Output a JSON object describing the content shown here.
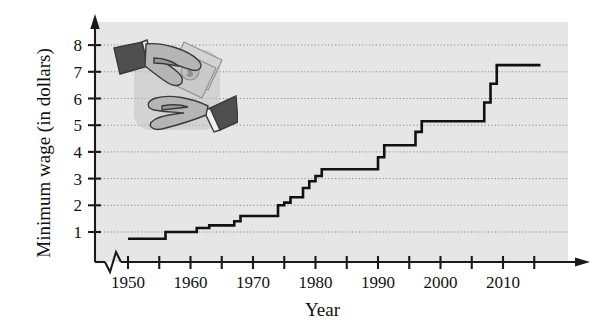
{
  "figure": {
    "width": 599,
    "height": 333,
    "background": "#ffffff",
    "plot_background": "#e6e6e6",
    "line_color": "#111111",
    "grid_color": "#8a8a8a",
    "axis_color": "#1a1a1a"
  },
  "illustration": {
    "name": "hands-exchanging-money",
    "description": "Two grayscale cartoon hands exchanging dollar bills",
    "colors": {
      "cuff_dark": "#4f4f4f",
      "skin": "#b5b5b5",
      "skin_shadow": "#9a9a9a",
      "money": "#cfcfcf",
      "outline": "#3a3a3a",
      "shadow": "#c2c2c2"
    }
  },
  "chart_data": {
    "type": "line",
    "line_style": "step-post",
    "title": "",
    "subtitle": "",
    "xlabel": "Year",
    "ylabel": "Minimum wage (in dollars)",
    "xlim": [
      1947,
      2017
    ],
    "ylim": [
      0,
      8.6
    ],
    "grid": true,
    "grid_axis": "y",
    "legend": false,
    "legend_position": "none",
    "axis_break_x": true,
    "axis_break_note": "zigzag break between origin and 1950 on the x-axis",
    "yticks": [
      1,
      2,
      3,
      4,
      5,
      6,
      7,
      8
    ],
    "ytick_labels": [
      "1",
      "2",
      "3",
      "4",
      "5",
      "6",
      "7",
      "8"
    ],
    "xticks": [
      1950,
      1955,
      1960,
      1965,
      1970,
      1975,
      1980,
      1985,
      1990,
      1995,
      2000,
      2005,
      2010,
      2015
    ],
    "xtick_labels_shown": [
      "1950",
      "1960",
      "1970",
      "1980",
      "1990",
      "2000",
      "2010"
    ],
    "xtick_labeled_values": [
      1950,
      1960,
      1970,
      1980,
      1990,
      2000,
      2010
    ],
    "x": [
      1950,
      1956,
      1961,
      1963,
      1967,
      1968,
      1974,
      1975,
      1976,
      1978,
      1979,
      1980,
      1981,
      1990,
      1991,
      1996,
      1997,
      2007,
      2008,
      2009,
      2016
    ],
    "values": [
      0.75,
      1.0,
      1.15,
      1.25,
      1.4,
      1.6,
      2.0,
      2.1,
      2.3,
      2.65,
      2.9,
      3.1,
      3.35,
      3.8,
      4.25,
      4.75,
      5.15,
      5.85,
      6.55,
      7.25,
      7.25
    ],
    "series": [
      {
        "name": "Federal minimum wage",
        "x": [
          1950,
          1956,
          1961,
          1963,
          1967,
          1968,
          1974,
          1975,
          1976,
          1978,
          1979,
          1980,
          1981,
          1990,
          1991,
          1996,
          1997,
          2007,
          2008,
          2009,
          2016
        ],
        "values": [
          0.75,
          1.0,
          1.15,
          1.25,
          1.4,
          1.6,
          2.0,
          2.1,
          2.3,
          2.65,
          2.9,
          3.1,
          3.35,
          3.8,
          4.25,
          4.75,
          5.15,
          5.85,
          6.55,
          7.25,
          7.25
        ]
      }
    ],
    "annotations": []
  }
}
